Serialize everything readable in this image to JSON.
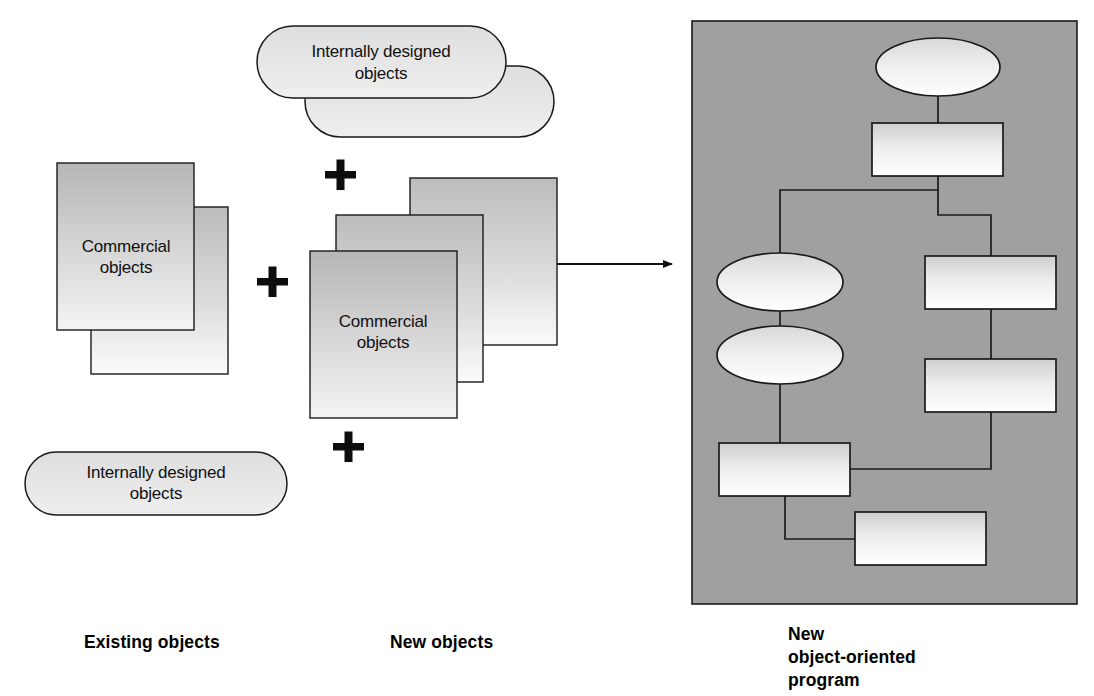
{
  "figure": {
    "background_color": "#ffffff",
    "panel_color": "#a0a0a0",
    "outline_color": "#1a1a1a",
    "plus_color": "#0d0d0d"
  },
  "groups": [
    {
      "id": "existing-objects",
      "caption": "Existing objects",
      "caption_x": 84,
      "caption_y": 648,
      "shapes": [
        {
          "kind": "rect-stack",
          "name": "commercial-objects-stack",
          "label": "Commercial\nobjects",
          "label_lines": [
            "Commercial",
            "objects"
          ]
        },
        {
          "kind": "pill",
          "name": "internally-designed-objects-pill",
          "label": "Internally designed\nobjects",
          "label_lines": [
            "Internally designed",
            "objects"
          ]
        }
      ]
    },
    {
      "id": "new-objects",
      "caption": "New objects",
      "caption_x": 390,
      "caption_y": 648,
      "shapes": [
        {
          "kind": "pill-stack",
          "name": "internally-designed-objects-stack",
          "label": "Internally designed\nobjects",
          "label_lines": [
            "Internally designed",
            "objects"
          ]
        },
        {
          "kind": "rect-stack",
          "name": "commercial-objects-stack",
          "label": "Commercial\nobjects",
          "label_lines": [
            "Commercial",
            "objects"
          ]
        }
      ]
    },
    {
      "id": "new-oo-program",
      "caption_lines": [
        "New",
        "object-oriented",
        "program"
      ],
      "caption_x": 788,
      "caption_y": 640
    }
  ],
  "operators": [
    {
      "name": "plus-sign-top-new",
      "x": 340,
      "y": 175,
      "symbol": "+"
    },
    {
      "name": "plus-sign-between",
      "x": 272,
      "y": 285,
      "symbol": "+"
    },
    {
      "name": "plus-sign-bottom-new",
      "x": 348,
      "y": 447,
      "symbol": "+"
    }
  ],
  "arrow": {
    "name": "result-arrow",
    "from_x": 557,
    "to_x": 676,
    "y": 264
  },
  "panel": {
    "name": "program-panel",
    "x": 692,
    "y": 21,
    "width": 385,
    "height": 583,
    "fill": "#a0a0a0"
  },
  "flow_nodes": [
    {
      "name": "flow-ellipse-1",
      "type": "ellipse",
      "cx": 938,
      "cy": 67,
      "rx": 62,
      "ry": 29
    },
    {
      "name": "flow-rect-1",
      "type": "rect",
      "x": 872,
      "y": 123,
      "w": 131,
      "h": 53
    },
    {
      "name": "flow-ellipse-2",
      "type": "ellipse",
      "cx": 780,
      "cy": 282,
      "rx": 63,
      "ry": 29
    },
    {
      "name": "flow-rect-2",
      "type": "rect",
      "x": 925,
      "y": 256,
      "w": 131,
      "h": 53
    },
    {
      "name": "flow-ellipse-3",
      "type": "ellipse",
      "cx": 780,
      "cy": 355,
      "rx": 63,
      "ry": 29
    },
    {
      "name": "flow-rect-3",
      "type": "rect",
      "x": 925,
      "y": 359,
      "w": 131,
      "h": 53
    },
    {
      "name": "flow-rect-4",
      "type": "rect",
      "x": 719,
      "y": 443,
      "w": 131,
      "h": 53
    },
    {
      "name": "flow-rect-5",
      "type": "rect",
      "x": 855,
      "y": 512,
      "w": 131,
      "h": 53
    }
  ],
  "flow_connectors": [
    {
      "name": "connector-e1-r1",
      "path": "M 938 96 L 938 123"
    },
    {
      "name": "connector-r1-fork",
      "path": "M 938 176 L 938 190 L 780 190 L 780 253"
    },
    {
      "name": "connector-fork-r2",
      "path": "M 938 190 L 938 215 L 991 215 L 991 256"
    },
    {
      "name": "connector-e2-e3",
      "path": "M 780 311 L 780 326"
    },
    {
      "name": "connector-e3-r4",
      "path": "M 780 384 L 780 443"
    },
    {
      "name": "connector-r2-r3",
      "path": "M 991 309 L 991 359"
    },
    {
      "name": "connector-r3-r4",
      "path": "M 991 412 L 991 469 L 850 469"
    },
    {
      "name": "connector-r4-r5",
      "path": "M 785 496 L 785 539 L 855 539"
    }
  ],
  "colors": {
    "shape_fill_light": "#f2f2f2",
    "shape_fill_dark": "#b9b9b9",
    "node_fill_light": "#ffffff",
    "node_fill_dark": "#cfcfcf",
    "stroke": "#1a1a1a"
  }
}
